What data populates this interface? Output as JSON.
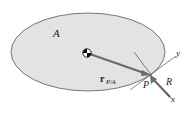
{
  "diagram": {
    "region_label": "A",
    "position_vector_label": "r",
    "position_vector_subscript": "P/A",
    "point_label": "P",
    "force_label": "R",
    "axis_x_label": "x",
    "axis_y_label": "y",
    "colors": {
      "region_fill": "#e3e3e3",
      "region_stroke": "#555555",
      "vector": "#6a6a6a",
      "axes": "#333333",
      "text": "#222222"
    }
  }
}
